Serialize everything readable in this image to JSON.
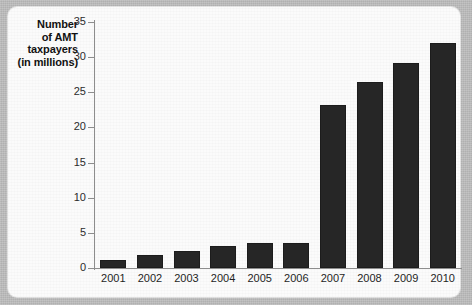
{
  "chart_data": {
    "type": "bar",
    "title": "",
    "xlabel": "",
    "ylabel": "Number of AMT taxpayers (in millions)",
    "ylabel_lines": [
      "Number",
      "of AMT",
      "taxpayers",
      "(in millions)"
    ],
    "categories": [
      "2001",
      "2002",
      "2003",
      "2004",
      "2005",
      "2006",
      "2007",
      "2008",
      "2009",
      "2010"
    ],
    "values": [
      1.2,
      1.9,
      2.4,
      3.1,
      3.5,
      3.5,
      23.2,
      26.5,
      29.2,
      32.0
    ],
    "ylim": [
      0,
      35
    ],
    "yticks": [
      0,
      5,
      10,
      15,
      20,
      25,
      30,
      35
    ],
    "ytick_labels": [
      "0",
      "5",
      "10",
      "15",
      "20",
      "25",
      "30",
      "35"
    ],
    "grid": false,
    "legend": null,
    "bar_color": "#262626",
    "axis_color": "#8d8d8d",
    "plot_background": "#fbfbfb",
    "page_background": "#bdbdbd"
  }
}
